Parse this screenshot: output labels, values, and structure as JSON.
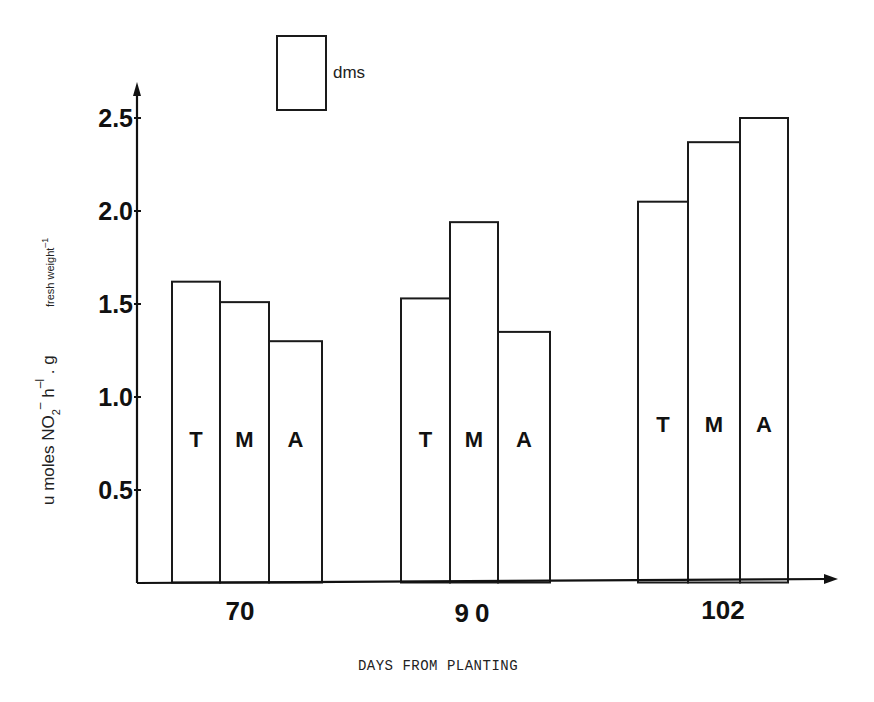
{
  "chart_data": {
    "type": "bar",
    "title": "",
    "xlabel": "DAYS FROM PLANTING",
    "ylabel": "u moles NO2- h-1 . g fresh weight-1",
    "ylabel_parts": {
      "main": "u moles NO",
      "sub": "2",
      "sup1": "–",
      "mid": " h",
      "sup2": "–l",
      "mid2": " . g",
      "small": "fresh weight",
      "sup3": "–1"
    },
    "categories": [
      "70",
      "90",
      "102"
    ],
    "series_labels": [
      "T",
      "M",
      "A"
    ],
    "series": [
      {
        "name": "T",
        "values": [
          1.62,
          1.53,
          2.05
        ]
      },
      {
        "name": "M",
        "values": [
          1.51,
          1.94,
          2.37
        ]
      },
      {
        "name": "A",
        "values": [
          1.3,
          1.35,
          2.5
        ]
      }
    ],
    "yticks": [
      "0.5",
      "1.0",
      "1.5",
      "2.0",
      "2.5"
    ],
    "ytick_values": [
      0.5,
      1.0,
      1.5,
      2.0,
      2.5
    ],
    "ylim": [
      0,
      2.6
    ],
    "grid": false,
    "legend": {
      "entries": [
        "dms"
      ],
      "position": "top"
    },
    "label_y_values": [
      0.73,
      0.73,
      0.81
    ]
  }
}
